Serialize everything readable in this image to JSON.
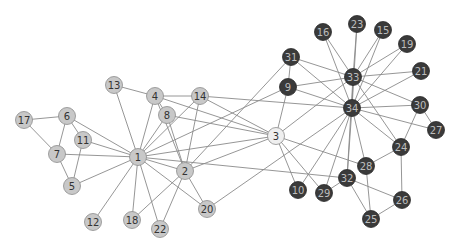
{
  "chart_data": {
    "type": "network",
    "title": "",
    "groups": {
      "light": {
        "fill": "#c8c8c8",
        "stroke": "#8c8c8c",
        "label_color": "#333333"
      },
      "dark": {
        "fill": "#3a3a3a",
        "stroke": "#2a2a2a",
        "label_color": "#bdbdbd"
      },
      "highlight": {
        "fill": "#efefef",
        "stroke": "#8c8c8c",
        "label_color": "#333333"
      }
    },
    "nodes": [
      {
        "id": "1",
        "x": 138,
        "y": 157,
        "group": "light"
      },
      {
        "id": "2",
        "x": 185,
        "y": 171,
        "group": "light"
      },
      {
        "id": "3",
        "x": 276,
        "y": 136,
        "group": "highlight"
      },
      {
        "id": "4",
        "x": 155,
        "y": 96,
        "group": "light"
      },
      {
        "id": "5",
        "x": 72,
        "y": 186,
        "group": "light"
      },
      {
        "id": "6",
        "x": 67,
        "y": 116,
        "group": "light"
      },
      {
        "id": "7",
        "x": 57,
        "y": 154,
        "group": "light"
      },
      {
        "id": "8",
        "x": 167,
        "y": 115,
        "group": "light"
      },
      {
        "id": "9",
        "x": 288,
        "y": 87,
        "group": "dark"
      },
      {
        "id": "10",
        "x": 298,
        "y": 190,
        "group": "dark"
      },
      {
        "id": "11",
        "x": 83,
        "y": 140,
        "group": "light"
      },
      {
        "id": "12",
        "x": 93,
        "y": 222,
        "group": "light"
      },
      {
        "id": "13",
        "x": 114,
        "y": 85,
        "group": "light"
      },
      {
        "id": "14",
        "x": 200,
        "y": 96,
        "group": "light"
      },
      {
        "id": "15",
        "x": 383,
        "y": 30,
        "group": "dark"
      },
      {
        "id": "16",
        "x": 323,
        "y": 32,
        "group": "dark"
      },
      {
        "id": "17",
        "x": 24,
        "y": 120,
        "group": "light"
      },
      {
        "id": "18",
        "x": 132,
        "y": 220,
        "group": "light"
      },
      {
        "id": "19",
        "x": 407,
        "y": 44,
        "group": "dark"
      },
      {
        "id": "20",
        "x": 207,
        "y": 209,
        "group": "light"
      },
      {
        "id": "21",
        "x": 421,
        "y": 71,
        "group": "dark"
      },
      {
        "id": "22",
        "x": 160,
        "y": 229,
        "group": "light"
      },
      {
        "id": "23",
        "x": 357,
        "y": 24,
        "group": "dark"
      },
      {
        "id": "24",
        "x": 401,
        "y": 147,
        "group": "dark"
      },
      {
        "id": "25",
        "x": 371,
        "y": 219,
        "group": "dark"
      },
      {
        "id": "26",
        "x": 402,
        "y": 200,
        "group": "dark"
      },
      {
        "id": "27",
        "x": 436,
        "y": 130,
        "group": "dark"
      },
      {
        "id": "28",
        "x": 366,
        "y": 166,
        "group": "dark"
      },
      {
        "id": "29",
        "x": 324,
        "y": 193,
        "group": "dark"
      },
      {
        "id": "30",
        "x": 420,
        "y": 105,
        "group": "dark"
      },
      {
        "id": "31",
        "x": 291,
        "y": 57,
        "group": "dark"
      },
      {
        "id": "32",
        "x": 347,
        "y": 178,
        "group": "dark"
      },
      {
        "id": "33",
        "x": 353,
        "y": 77,
        "group": "dark"
      },
      {
        "id": "34",
        "x": 352,
        "y": 108,
        "group": "dark"
      }
    ],
    "edges": [
      [
        "1",
        "2"
      ],
      [
        "1",
        "3"
      ],
      [
        "1",
        "4"
      ],
      [
        "1",
        "5"
      ],
      [
        "1",
        "6"
      ],
      [
        "1",
        "7"
      ],
      [
        "1",
        "8"
      ],
      [
        "1",
        "9"
      ],
      [
        "1",
        "11"
      ],
      [
        "1",
        "12"
      ],
      [
        "1",
        "13"
      ],
      [
        "1",
        "14"
      ],
      [
        "1",
        "18"
      ],
      [
        "1",
        "20"
      ],
      [
        "1",
        "22"
      ],
      [
        "1",
        "32"
      ],
      [
        "2",
        "3"
      ],
      [
        "2",
        "4"
      ],
      [
        "2",
        "8"
      ],
      [
        "2",
        "14"
      ],
      [
        "2",
        "18"
      ],
      [
        "2",
        "20"
      ],
      [
        "2",
        "22"
      ],
      [
        "2",
        "31"
      ],
      [
        "3",
        "4"
      ],
      [
        "3",
        "8"
      ],
      [
        "3",
        "9"
      ],
      [
        "3",
        "10"
      ],
      [
        "3",
        "14"
      ],
      [
        "3",
        "28"
      ],
      [
        "3",
        "29"
      ],
      [
        "3",
        "33"
      ],
      [
        "4",
        "8"
      ],
      [
        "4",
        "13"
      ],
      [
        "4",
        "14"
      ],
      [
        "5",
        "7"
      ],
      [
        "5",
        "11"
      ],
      [
        "6",
        "7"
      ],
      [
        "6",
        "11"
      ],
      [
        "6",
        "17"
      ],
      [
        "7",
        "17"
      ],
      [
        "9",
        "31"
      ],
      [
        "9",
        "33"
      ],
      [
        "9",
        "34"
      ],
      [
        "10",
        "34"
      ],
      [
        "14",
        "34"
      ],
      [
        "15",
        "33"
      ],
      [
        "15",
        "34"
      ],
      [
        "16",
        "33"
      ],
      [
        "16",
        "34"
      ],
      [
        "19",
        "33"
      ],
      [
        "19",
        "34"
      ],
      [
        "20",
        "34"
      ],
      [
        "21",
        "33"
      ],
      [
        "21",
        "34"
      ],
      [
        "23",
        "33"
      ],
      [
        "23",
        "34"
      ],
      [
        "24",
        "26"
      ],
      [
        "24",
        "28"
      ],
      [
        "24",
        "30"
      ],
      [
        "24",
        "33"
      ],
      [
        "24",
        "34"
      ],
      [
        "25",
        "26"
      ],
      [
        "25",
        "28"
      ],
      [
        "25",
        "32"
      ],
      [
        "26",
        "32"
      ],
      [
        "27",
        "30"
      ],
      [
        "27",
        "34"
      ],
      [
        "28",
        "34"
      ],
      [
        "29",
        "32"
      ],
      [
        "29",
        "34"
      ],
      [
        "30",
        "33"
      ],
      [
        "30",
        "34"
      ],
      [
        "31",
        "33"
      ],
      [
        "31",
        "34"
      ],
      [
        "32",
        "33"
      ],
      [
        "32",
        "34"
      ],
      [
        "33",
        "34"
      ]
    ],
    "node_radius": 8.5,
    "xlabel": "",
    "ylabel": ""
  }
}
